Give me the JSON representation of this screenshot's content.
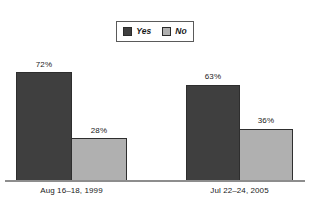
{
  "chart_data": {
    "type": "bar",
    "title": "",
    "subtitle": "",
    "xlabel": "",
    "ylabel": "",
    "ylim": [
      0,
      100
    ],
    "grid": false,
    "legend_position": "top-center",
    "categories": [
      "Aug 16–18, 1999",
      "Jul 22–24, 2005"
    ],
    "series": [
      {
        "name": "Yes",
        "color": "#3f3f3f",
        "values": [
          72,
          63
        ],
        "labels": [
          "72%",
          "36%"
        ]
      },
      {
        "name": "No",
        "color": "#b0b0b0",
        "values": [
          28,
          36
        ],
        "labels": [
          "28%",
          "36%"
        ]
      }
    ],
    "bars": [
      {
        "group": "Aug 16–18, 1999",
        "series": "Yes",
        "value": 72,
        "label": "72%"
      },
      {
        "group": "Aug 16–18, 1999",
        "series": "No",
        "value": 28,
        "label": "28%"
      },
      {
        "group": "Jul 22–24, 2005",
        "series": "Yes",
        "value": 63,
        "label": "63%"
      },
      {
        "group": "Jul 22–24, 2005",
        "series": "No",
        "value": 36,
        "label": "36%"
      }
    ]
  },
  "legend": {
    "items": [
      {
        "label": "Yes",
        "swatch_color": "#3f3f3f",
        "icon": "legend-swatch-dark"
      },
      {
        "label": "No",
        "swatch_color": "#b0b0b0",
        "icon": "legend-swatch-light"
      }
    ]
  },
  "axis": {
    "baseline_color": "#8d8d8d",
    "categories": [
      "Aug 16–18, 1999",
      "Jul 22–24, 2005"
    ]
  },
  "colors": {
    "background": "#ffffff",
    "yes_bar": "#3f3f3f",
    "no_bar": "#b0b0b0",
    "bar_border": "#2e2e2e",
    "text": "#1a1a1a",
    "legend_border": "#5a5a5a"
  }
}
